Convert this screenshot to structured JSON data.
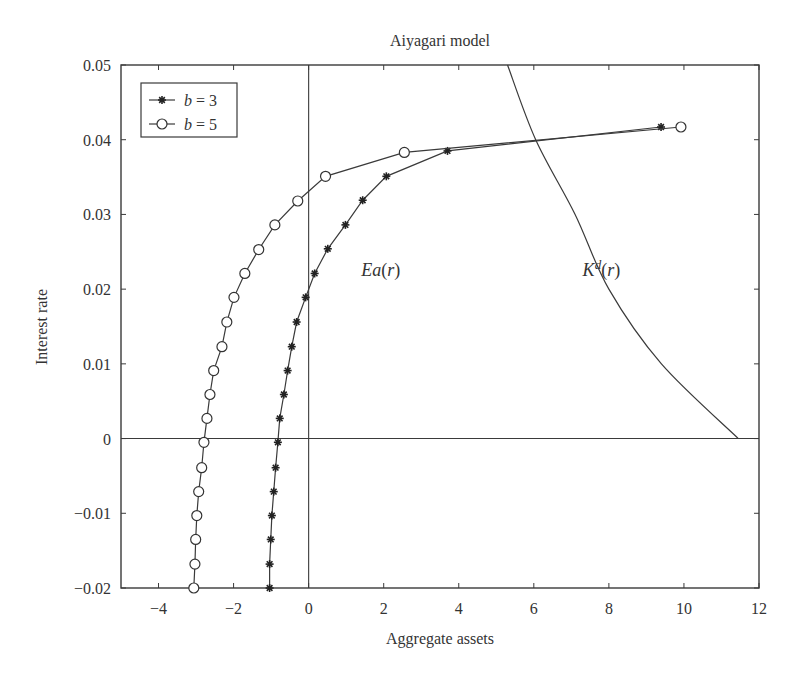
{
  "chart_data": {
    "type": "line",
    "title": "Aiyagari model",
    "xlabel": "Aggregate assets",
    "ylabel": "Interest rate",
    "xlim": [
      -5,
      12
    ],
    "ylim": [
      -0.02,
      0.05
    ],
    "xticks": [
      -4,
      -2,
      0,
      2,
      4,
      6,
      8,
      10,
      12
    ],
    "xtick_labels": [
      "−4",
      "−2",
      "0",
      "2",
      "4",
      "6",
      "8",
      "10",
      "12"
    ],
    "yticks": [
      -0.02,
      -0.01,
      0,
      0.01,
      0.02,
      0.03,
      0.04,
      0.05
    ],
    "ytick_labels": [
      "−0.02",
      "−0.01",
      "0",
      "0.01",
      "0.02",
      "0.03",
      "0.04",
      "0.05"
    ],
    "grid": false,
    "reference_lines": {
      "x0": true,
      "y0": true
    },
    "legend": {
      "position": "upper left",
      "entries": [
        {
          "label_var": "b",
          "label_rest": " = 3",
          "marker": "star"
        },
        {
          "label_var": "b",
          "label_rest": " = 5",
          "marker": "circle"
        }
      ]
    },
    "series": [
      {
        "name": "b = 3",
        "marker": "star",
        "points": [
          [
            -1.04,
            -0.02
          ],
          [
            -1.04,
            -0.0168
          ],
          [
            -1.01,
            -0.0135
          ],
          [
            -0.98,
            -0.0103
          ],
          [
            -0.93,
            -0.0071
          ],
          [
            -0.88,
            -0.0039
          ],
          [
            -0.82,
            -0.0005
          ],
          [
            -0.77,
            0.0027
          ],
          [
            -0.66,
            0.0059
          ],
          [
            -0.56,
            0.0091
          ],
          [
            -0.45,
            0.0123
          ],
          [
            -0.32,
            0.0156
          ],
          [
            -0.08,
            0.0189
          ],
          [
            0.16,
            0.0221
          ],
          [
            0.51,
            0.0254
          ],
          [
            0.98,
            0.0286
          ],
          [
            1.44,
            0.0319
          ],
          [
            2.07,
            0.0351
          ],
          [
            3.7,
            0.0385
          ],
          [
            9.39,
            0.0417
          ]
        ]
      },
      {
        "name": "b = 5",
        "marker": "circle",
        "points": [
          [
            -3.06,
            -0.02
          ],
          [
            -3.03,
            -0.0168
          ],
          [
            -3.01,
            -0.0135
          ],
          [
            -2.98,
            -0.0103
          ],
          [
            -2.93,
            -0.0071
          ],
          [
            -2.85,
            -0.0039
          ],
          [
            -2.79,
            -0.0005
          ],
          [
            -2.71,
            0.0027
          ],
          [
            -2.63,
            0.0059
          ],
          [
            -2.53,
            0.0091
          ],
          [
            -2.31,
            0.0123
          ],
          [
            -2.18,
            0.0156
          ],
          [
            -1.99,
            0.0189
          ],
          [
            -1.7,
            0.0221
          ],
          [
            -1.33,
            0.0253
          ],
          [
            -0.9,
            0.0286
          ],
          [
            -0.29,
            0.0318
          ],
          [
            0.45,
            0.0351
          ],
          [
            2.55,
            0.0383
          ],
          [
            9.92,
            0.0417
          ]
        ]
      },
      {
        "name": "Kd(r)",
        "marker": "none",
        "points": [
          [
            5.3,
            0.05
          ],
          [
            6.05,
            0.04
          ],
          [
            7.1,
            0.03
          ],
          [
            8.0,
            0.02
          ],
          [
            9.4,
            0.01
          ],
          [
            11.45,
            0.0
          ]
        ]
      }
    ],
    "annotations": [
      {
        "text_var": "Ea",
        "text_rest": "(r)",
        "x": 1.4,
        "y": 0.0225
      },
      {
        "text_var": "K",
        "sup": "d",
        "text_rest": "(r)",
        "x": 7.3,
        "y": 0.0225
      }
    ]
  }
}
